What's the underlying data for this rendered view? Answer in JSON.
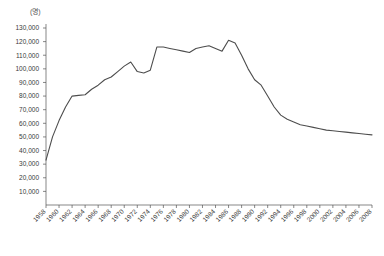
{
  "chart_data": {
    "type": "line",
    "title": "",
    "subtitle": "",
    "xlabel": "",
    "ylabel": "",
    "unit_label": "(명)",
    "grid": false,
    "legend": null,
    "legend_position": "none",
    "line_color": "#4d4d4d",
    "axis_color": "#555555",
    "xlim": [
      1958,
      2008
    ],
    "ylim": [
      0,
      130000
    ],
    "ytick_labels": [
      "130,000",
      "120,000",
      "110,000",
      "100,000",
      "90,000",
      "80,000",
      "70,000",
      "60,000",
      "50,000",
      "40,000",
      "30,000",
      "20,000",
      "10,000"
    ],
    "ytick_values": [
      130000,
      120000,
      110000,
      100000,
      90000,
      80000,
      70000,
      60000,
      50000,
      40000,
      30000,
      20000,
      10000
    ],
    "xtick_labels": [
      "1958",
      "1960",
      "1962",
      "1964",
      "1966",
      "1968",
      "1970",
      "1972",
      "1974",
      "1976",
      "1978",
      "1980",
      "1982",
      "1984",
      "1986",
      "1988",
      "1990",
      "1992",
      "1994",
      "1996",
      "1998",
      "2000",
      "2002",
      "2004",
      "2006",
      "2008"
    ],
    "x": [
      1958,
      1959,
      1960,
      1961,
      1962,
      1963,
      1964,
      1965,
      1966,
      1967,
      1968,
      1969,
      1970,
      1971,
      1972,
      1973,
      1974,
      1975,
      1976,
      1977,
      1978,
      1979,
      1980,
      1981,
      1982,
      1983,
      1984,
      1985,
      1986,
      1987,
      1988,
      1989,
      1990,
      1991,
      1992,
      1993,
      1994,
      1995,
      1996,
      1997,
      1998,
      1999,
      2000,
      2001,
      2002,
      2003,
      2004,
      2005,
      2006,
      2007,
      2008
    ],
    "values": [
      33000,
      50000,
      62000,
      72000,
      80000,
      80500,
      81000,
      85000,
      88000,
      92000,
      94000,
      98000,
      102000,
      105000,
      98000,
      97000,
      99000,
      116000,
      116000,
      115000,
      114000,
      113000,
      112000,
      115000,
      116000,
      117000,
      115000,
      113000,
      121000,
      119000,
      110000,
      100000,
      92000,
      88000,
      80000,
      72000,
      66000,
      63000,
      61000,
      59000,
      58000,
      57000,
      56000,
      55000,
      54500,
      54000,
      53500,
      53000,
      52500,
      52000,
      51500
    ]
  }
}
